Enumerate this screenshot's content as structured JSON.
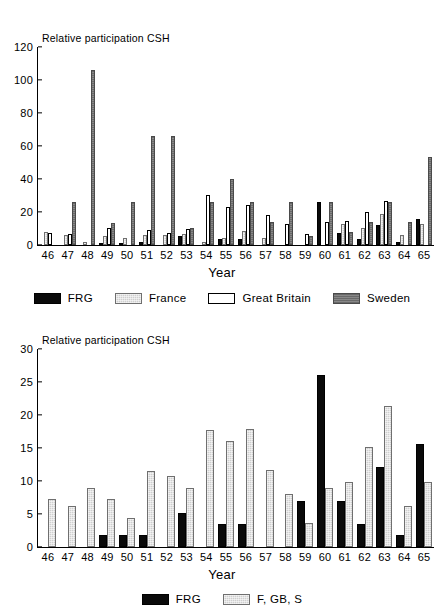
{
  "figures": [
    {
      "id": "top",
      "axis_title_y": "Relative participation CSH",
      "axis_title_x": "Year",
      "legend": [
        {
          "label": "FRG",
          "series_key": "frg",
          "color": "#0a0a0a"
        },
        {
          "label": "France",
          "series_key": "france",
          "color": "#cfcfcf"
        },
        {
          "label": "Great Britain",
          "series_key": "gb",
          "color": "#ffffff"
        },
        {
          "label": "Sweden",
          "series_key": "sweden",
          "color": "#7a7a7a"
        }
      ]
    },
    {
      "id": "bottom",
      "axis_title_y": "Relative participation CSH",
      "axis_title_x": "Year",
      "legend": [
        {
          "label": "FRG",
          "series_key": "frg",
          "color": "#0a0a0a"
        },
        {
          "label": "F, GB, S",
          "series_key": "fgbs",
          "color": "#cfcfcf"
        }
      ]
    }
  ],
  "chart_data": [
    {
      "type": "bar",
      "id": "top",
      "title": "",
      "xlabel": "Year",
      "ylabel": "Relative participation CSH",
      "ylim": [
        0,
        120
      ],
      "yticks": [
        0,
        20,
        40,
        60,
        80,
        100,
        120
      ],
      "grid": false,
      "legend_position": "bottom",
      "categories": [
        "46",
        "47",
        "48",
        "49",
        "50",
        "51",
        "52",
        "53",
        "54",
        "55",
        "56",
        "57",
        "58",
        "59",
        "60",
        "61",
        "62",
        "63",
        "64",
        "65"
      ],
      "series": [
        {
          "name": "FRG",
          "values": [
            0,
            0,
            0,
            1.5,
            1.5,
            1.8,
            0,
            5.2,
            0,
            3.5,
            3.5,
            0,
            0,
            0,
            25.8,
            7.0,
            3.5,
            12.2,
            1.8,
            15.8
          ]
        },
        {
          "name": "France",
          "values": [
            8.0,
            6.2,
            1.8,
            5.2,
            4.4,
            5.8,
            6.2,
            6.8,
            1.8,
            4.4,
            8.5,
            4.4,
            0,
            0,
            0,
            12.5,
            10.5,
            18.5,
            6.2,
            13.0
          ]
        },
        {
          "name": "Great Britain",
          "values": [
            7.2,
            6.8,
            0,
            10.5,
            0,
            8.8,
            7.0,
            9.5,
            30.5,
            23.0,
            24.5,
            18.0,
            12.8,
            6.8,
            14.2,
            14.8,
            19.8,
            26.5,
            0,
            0
          ]
        },
        {
          "name": "Sweden",
          "values": [
            0,
            26.0,
            106.0,
            13.2,
            26.0,
            66.0,
            66.0,
            10.5,
            26.0,
            39.8,
            26.0,
            13.8,
            26.0,
            5.2,
            26.0,
            7.8,
            13.8,
            26.0,
            13.8,
            53.5
          ]
        }
      ]
    },
    {
      "type": "bar",
      "id": "bottom",
      "title": "",
      "xlabel": "Year",
      "ylabel": "Relative participation CSH",
      "ylim": [
        0,
        30
      ],
      "yticks": [
        0,
        5,
        10,
        15,
        20,
        25,
        30
      ],
      "grid": false,
      "legend_position": "bottom",
      "categories": [
        "46",
        "47",
        "48",
        "49",
        "50",
        "51",
        "52",
        "53",
        "54",
        "55",
        "56",
        "57",
        "58",
        "59",
        "60",
        "61",
        "62",
        "63",
        "64",
        "65"
      ],
      "series": [
        {
          "name": "FRG",
          "values": [
            0,
            0,
            0,
            1.8,
            1.8,
            1.8,
            0,
            5.2,
            0,
            3.5,
            3.5,
            0,
            0,
            6.9,
            26.0,
            6.9,
            3.5,
            12.1,
            1.8,
            15.6
          ]
        },
        {
          "name": "F, GB, S",
          "values": [
            7.2,
            6.2,
            8.9,
            7.2,
            4.4,
            11.5,
            10.7,
            8.9,
            17.8,
            16.1,
            17.9,
            11.6,
            8.0,
            3.6,
            8.9,
            9.8,
            15.2,
            21.4,
            6.2,
            9.8
          ]
        }
      ]
    }
  ]
}
